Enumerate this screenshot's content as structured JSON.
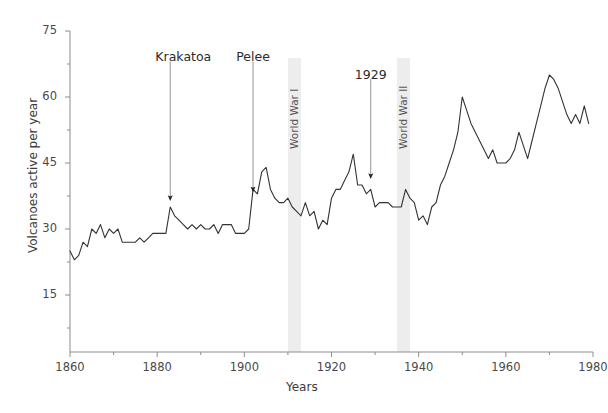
{
  "chart_data": {
    "type": "line",
    "title": "",
    "xlabel": "Years",
    "ylabel": "Volcanoes active per year",
    "xlim": [
      1860,
      1980
    ],
    "ylim": [
      0,
      75
    ],
    "x_ticks": [
      1860,
      1880,
      1900,
      1920,
      1940,
      1960,
      1980
    ],
    "x_minor_ticks": [
      1870,
      1890,
      1910,
      1930,
      1950,
      1970
    ],
    "y_ticks": [
      15,
      30,
      45,
      60,
      75
    ],
    "y_minor_ticks": [
      7.5,
      22.5,
      37.5,
      52.5,
      67.5
    ],
    "grid": false,
    "legend": "none",
    "series": [
      {
        "name": "Volcanoes active per year",
        "color": "#333333",
        "x": [
          1860,
          1861,
          1862,
          1863,
          1864,
          1865,
          1866,
          1867,
          1868,
          1869,
          1870,
          1871,
          1872,
          1873,
          1874,
          1875,
          1876,
          1877,
          1878,
          1879,
          1880,
          1881,
          1882,
          1883,
          1884,
          1885,
          1886,
          1887,
          1888,
          1889,
          1890,
          1891,
          1892,
          1893,
          1894,
          1895,
          1896,
          1897,
          1898,
          1899,
          1900,
          1901,
          1902,
          1903,
          1904,
          1905,
          1906,
          1907,
          1908,
          1909,
          1910,
          1911,
          1912,
          1913,
          1914,
          1915,
          1916,
          1917,
          1918,
          1919,
          1920,
          1921,
          1922,
          1923,
          1924,
          1925,
          1926,
          1927,
          1928,
          1929,
          1930,
          1931,
          1932,
          1933,
          1934,
          1935,
          1936,
          1937,
          1938,
          1939,
          1940,
          1941,
          1942,
          1943,
          1944,
          1945,
          1946,
          1947,
          1948,
          1949,
          1950,
          1951,
          1952,
          1953,
          1954,
          1955,
          1956,
          1957,
          1958,
          1959,
          1960,
          1961,
          1962,
          1963,
          1964,
          1965,
          1966,
          1967,
          1968,
          1969,
          1970,
          1971,
          1972,
          1973,
          1974,
          1975,
          1976,
          1977,
          1978,
          1979
        ],
        "y": [
          25,
          23,
          24,
          27,
          26,
          30,
          29,
          31,
          28,
          30,
          29,
          30,
          27,
          27,
          27,
          27,
          28,
          27,
          28,
          29,
          29,
          29,
          29,
          35,
          33,
          32,
          31,
          30,
          31,
          30,
          31,
          30,
          30,
          31,
          29,
          31,
          31,
          31,
          29,
          29,
          29,
          30,
          39,
          38,
          43,
          44,
          39,
          37,
          36,
          36,
          37,
          35,
          34,
          33,
          36,
          33,
          34,
          30,
          32,
          31,
          37,
          39,
          39,
          41,
          43,
          47,
          40,
          40,
          38,
          39,
          35,
          36,
          36,
          36,
          35,
          35,
          35,
          39,
          37,
          36,
          32,
          33,
          31,
          35,
          36,
          40,
          42,
          45,
          48,
          52,
          60,
          57,
          54,
          52,
          50,
          48,
          46,
          48,
          45,
          45,
          45,
          46,
          48,
          52,
          49,
          46,
          50,
          54,
          58,
          62,
          65,
          64,
          62,
          59,
          56,
          54,
          56,
          54,
          58,
          54
        ]
      }
    ],
    "bands": [
      {
        "label": "World War I",
        "start": 1910,
        "end": 1913
      },
      {
        "label": "World War II",
        "start": 1935,
        "end": 1938
      }
    ],
    "annotations": [
      {
        "label": "Krakatoa",
        "text_x": 1886,
        "text_y": 69,
        "target_x": 1883,
        "target_y": 37
      },
      {
        "label": "Pelee",
        "text_x": 1902,
        "text_y": 69,
        "target_x": 1902,
        "target_y": 39
      },
      {
        "label": "1929",
        "text_x": 1929,
        "text_y": 65,
        "target_x": 1929,
        "target_y": 42
      }
    ]
  },
  "axis": {
    "x_tick_labels": [
      "1860",
      "1880",
      "1900",
      "1920",
      "1940",
      "1960",
      "1980"
    ],
    "y_tick_labels": [
      "15",
      "30",
      "45",
      "60",
      "75"
    ],
    "x_title": "Years",
    "y_title": "Volcanoes active per year"
  },
  "annotations": {
    "krakatoa": "Krakatoa",
    "pelee": "Pelee",
    "year_1929": "1929",
    "ww1": "World War I",
    "ww2": "World War II"
  },
  "colors": {
    "line": "#333333",
    "axis": "#8c8c8c",
    "band": "#ededed",
    "text": "#3b3b3b",
    "background": "#ffffff"
  }
}
